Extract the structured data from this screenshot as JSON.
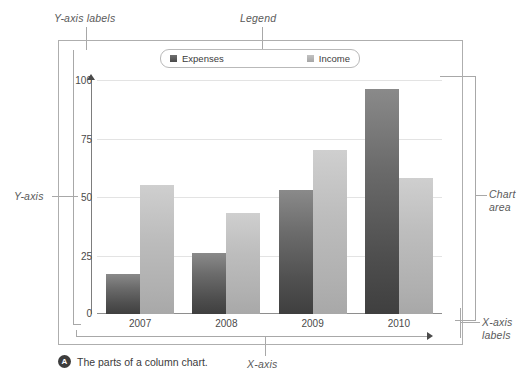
{
  "figure": {
    "caption_badge": "A",
    "caption_text": "The parts of a column chart."
  },
  "annotations": {
    "y_axis_labels": "Y-axis labels",
    "legend": "Legend",
    "y_axis": "Y-axis",
    "chart_area_line1": "Chart",
    "chart_area_line2": "area",
    "x_axis_labels_line1": "X-axis",
    "x_axis_labels_line2": "labels",
    "x_axis": "X-axis"
  },
  "legend": {
    "items": [
      {
        "label": "Expenses",
        "color": "#4e4e4e",
        "swatch": "expenses"
      },
      {
        "label": "Income",
        "color": "#b0b0b0",
        "swatch": "income"
      }
    ]
  },
  "chart_data": {
    "type": "bar",
    "title": "",
    "xlabel": "",
    "ylabel": "",
    "categories": [
      "2007",
      "2008",
      "2009",
      "2010"
    ],
    "series": [
      {
        "name": "Expenses",
        "color": "#4e4e4e",
        "values": [
          17,
          26,
          53,
          96
        ]
      },
      {
        "name": "Income",
        "color": "#b0b0b0",
        "values": [
          55,
          43,
          70,
          58
        ]
      }
    ],
    "yticks": [
      0,
      25,
      50,
      75,
      100
    ],
    "ylim": [
      0,
      100
    ],
    "grid": true,
    "legend_position": "top"
  }
}
